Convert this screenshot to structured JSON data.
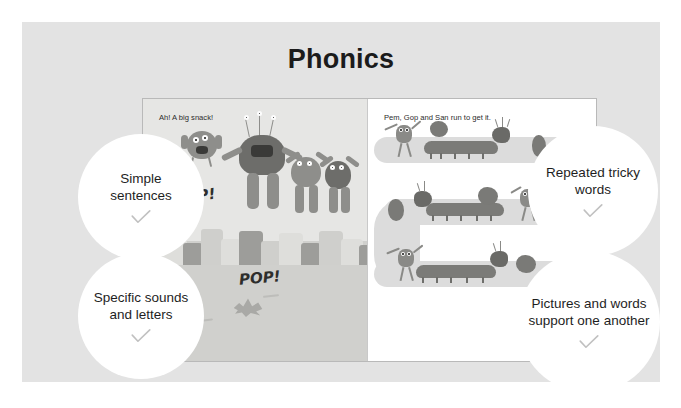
{
  "slide": {
    "title": "Phonics",
    "background_color": "#e3e3e3",
    "title_color": "#1b1b1b"
  },
  "book": {
    "left_page": {
      "caption": "Ah! A big snack!",
      "sound_effects": [
        "PIP!",
        "POP!"
      ]
    },
    "right_page": {
      "caption": "Pem, Gop and San run to get it."
    }
  },
  "callouts": [
    {
      "id": "simple-sentences",
      "text": "Simple sentences",
      "check": "checkmark"
    },
    {
      "id": "specific-sounds-and-letters",
      "text": "Specific sounds and letters",
      "check": "checkmark"
    },
    {
      "id": "repeated-tricky-words",
      "text": "Repeated tricky words",
      "check": "checkmark"
    },
    {
      "id": "pictures-and-words-support-one-another",
      "text": "Pictures and words support one another",
      "check": "checkmark"
    }
  ]
}
